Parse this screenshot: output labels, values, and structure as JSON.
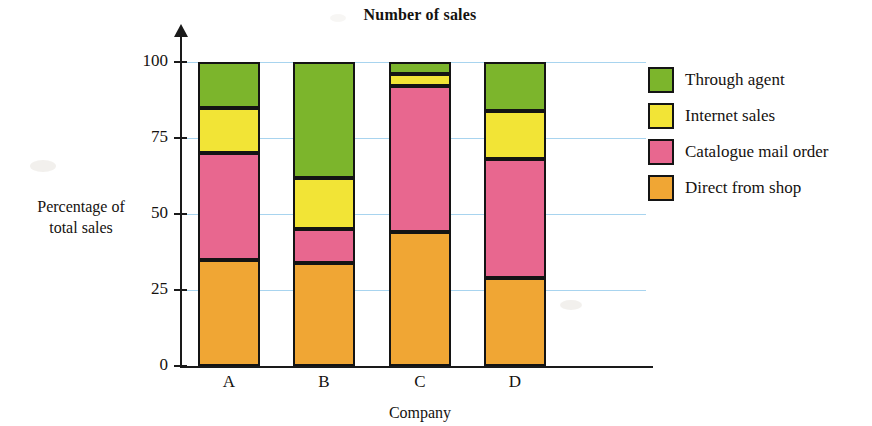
{
  "chart_data": {
    "type": "bar",
    "subtype": "stacked-percentage",
    "title": "Number of sales",
    "xlabel": "Company",
    "ylabel": "Percentage of\ntotal sales",
    "categories": [
      "A",
      "B",
      "C",
      "D"
    ],
    "ylim": [
      0,
      100
    ],
    "yticks": [
      0,
      25,
      50,
      75,
      100
    ],
    "ytick_labels": [
      "0",
      "25",
      "50",
      "75",
      "100"
    ],
    "grid": true,
    "grid_color": "#a8d4ef",
    "legend_position": "right",
    "stack_order_bottom_to_top": [
      "Direct from shop",
      "Catalogue mail order",
      "Internet sales",
      "Through agent"
    ],
    "series": [
      {
        "name": "Direct from shop",
        "color": "#f0a634",
        "values": [
          35,
          34,
          44,
          29
        ]
      },
      {
        "name": "Catalogue mail order",
        "color": "#e8678f",
        "values": [
          35,
          11,
          48,
          39
        ]
      },
      {
        "name": "Internet sales",
        "color": "#f2e436",
        "values": [
          15,
          17,
          4,
          16
        ]
      },
      {
        "name": "Through agent",
        "color": "#7cb52c",
        "values": [
          15,
          38,
          4,
          16
        ]
      }
    ],
    "cumulative_tops": {
      "A": [
        35,
        70,
        85,
        100
      ],
      "B": [
        34,
        45,
        62,
        100
      ],
      "C": [
        44,
        92,
        96,
        100
      ],
      "D": [
        29,
        68,
        84,
        100
      ]
    }
  },
  "title": "Number of sales",
  "axes": {
    "y_title": "Percentage of",
    "y_title_line2": "total sales",
    "x_title": "Company",
    "y_ticks": [
      {
        "label": "100",
        "value": 100
      },
      {
        "label": "75",
        "value": 75
      },
      {
        "label": "50",
        "value": 50
      },
      {
        "label": "25",
        "value": 25
      },
      {
        "label": "0",
        "value": 0
      }
    ],
    "x_ticks": [
      {
        "label": "A"
      },
      {
        "label": "B"
      },
      {
        "label": "C"
      },
      {
        "label": "D"
      }
    ]
  },
  "legend": {
    "items": [
      {
        "label": "Through agent",
        "color": "#7cb52c",
        "swatch": "green"
      },
      {
        "label": "Internet sales",
        "color": "#f2e436",
        "swatch": "yellow"
      },
      {
        "label": "Catalogue mail order",
        "color": "#e8678f",
        "swatch": "pink"
      },
      {
        "label": "Direct from shop",
        "color": "#f0a634",
        "swatch": "orange"
      }
    ]
  }
}
